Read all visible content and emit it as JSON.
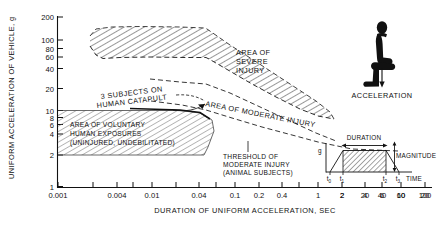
{
  "figure": {
    "background_color": "#ffffff",
    "ink_color": "#111111",
    "hatch_color": "#555555"
  },
  "axes": {
    "y_title": "UNIFORM ACCELERATION OF VEHICLE, g",
    "x_title": "DURATION OF UNIFORM ACCELERATION, SEC",
    "y_ticks": [
      "200",
      "100",
      "80",
      "60",
      "40",
      "20",
      "10",
      "8",
      "6",
      "4",
      "2",
      "1"
    ],
    "x_ticks": [
      "0.001",
      "0.004",
      "0.01",
      "0.04",
      "0.1",
      "0.2",
      "0.4",
      "1",
      "2",
      "4",
      "6",
      "10",
      "20",
      "40",
      "60",
      "100"
    ]
  },
  "annotations": {
    "severe": "AREA OF\nSEVERE\nINJURY",
    "severe_l1": "AREA OF",
    "severe_l2": "SEVERE",
    "severe_l3": "INJURY",
    "moderate": "AREA OF MODERATE INJURY",
    "catapult_l1": "3 SUBJECTS ON",
    "catapult_l2": "HUMAN CATAPULT",
    "voluntary_l1": "AREA OF VOLUNTARY",
    "voluntary_l2": "HUMAN EXPOSURES",
    "voluntary_l3": "(UNINJURED, UNDEBILITATED)",
    "threshold_l1": "THRESHOLD OF",
    "threshold_l2": "MODERATE INJURY",
    "threshold_l3": "(ANIMAL SUBJECTS)",
    "acceleration_icon_label": "ACCELERATION"
  },
  "inset": {
    "duration_label": "DURATION",
    "magnitude_label": "MAGNITUDE",
    "time_label": "TIME",
    "g_label": "g",
    "t0": "t",
    "t0s": "0",
    "t1": "t",
    "t1s": "1",
    "t2": "t",
    "t2s": "2",
    "t3": "t",
    "t3s": "3"
  },
  "chart_data": {
    "type": "area",
    "title": "",
    "xlabel": "DURATION OF UNIFORM ACCELERATION, SEC",
    "ylabel": "UNIFORM ACCELERATION OF VEHICLE, g",
    "x_scale": "log",
    "y_scale": "log",
    "xlim": [
      0.001,
      140
    ],
    "ylim": [
      1,
      200
    ],
    "grid": false,
    "legend": "none",
    "x_tick_values": [
      0.001,
      0.004,
      0.01,
      0.04,
      0.1,
      0.2,
      0.4,
      1,
      2,
      4,
      6,
      10,
      20,
      40,
      60,
      100
    ],
    "y_tick_values": [
      200,
      100,
      80,
      60,
      40,
      20,
      10,
      8,
      6,
      4,
      2,
      1
    ],
    "series": [
      {
        "name": "Area of severe injury (upper bound)",
        "x": [
          0.0035,
          0.006,
          0.02,
          0.06,
          0.2,
          0.22,
          0.45,
          1.0,
          2.5,
          6.0,
          20.0
        ],
        "values": [
          120,
          145,
          150,
          150,
          148,
          110,
          85,
          62,
          42,
          26,
          13
        ]
      },
      {
        "name": "Area of severe injury (lower bound) / threshold of severe injury",
        "x": [
          0.0035,
          0.006,
          0.02,
          0.06,
          0.2,
          0.22,
          0.45,
          1.0,
          2.5,
          6.0,
          20.0
        ],
        "values": [
          88,
          62,
          57,
          55,
          53,
          42,
          30,
          22,
          15,
          11,
          7
        ]
      },
      {
        "name": "Area of moderate injury (lower bound) / threshold of moderate injury (animal subjects)",
        "x": [
          0.006,
          0.02,
          0.06,
          0.2,
          0.45,
          1.0,
          2.5,
          6.0,
          20.0,
          40.0
        ],
        "values": [
          30,
          26,
          24,
          22,
          17,
          13,
          10,
          7.5,
          5.2,
          4.6
        ]
      },
      {
        "name": "Area of voluntary human exposures (upper bound)",
        "x": [
          0.001,
          0.1,
          0.3,
          0.9,
          1.3,
          2.0
        ],
        "values": [
          10,
          10,
          9.3,
          8.6,
          6.0,
          3.4
        ]
      },
      {
        "name": "Area of voluntary human exposures (lower bound)",
        "x": [
          0.001,
          2.0
        ],
        "values": [
          2.1,
          2.1
        ]
      },
      {
        "name": "3 subjects on human catapult (solid line)",
        "x": [
          0.1,
          0.9,
          1.3
        ],
        "values": [
          10,
          8.6,
          6.0
        ]
      }
    ]
  }
}
